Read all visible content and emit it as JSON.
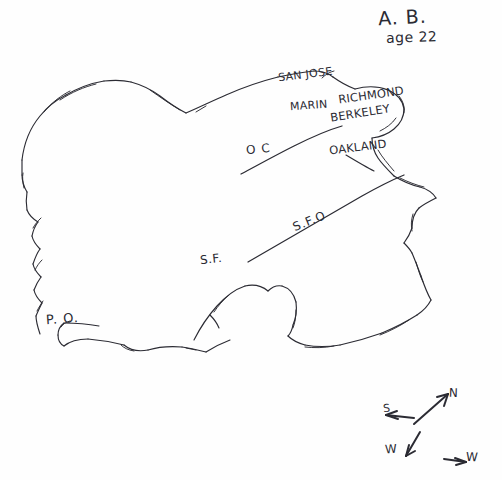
{
  "page": {
    "background_color": "#fefefe",
    "ink_color": "#2b2b33",
    "width": 502,
    "height": 480
  },
  "header": {
    "initials": "A. B.",
    "age": "age 22"
  },
  "labels": {
    "san_jose": "SAN JOSE",
    "marin": "MARIN",
    "richmond": "RICHMOND",
    "berkeley": "BERKELEY",
    "oakland": "OAKLAND",
    "oc": "O C",
    "sfo": "S.F.O",
    "sf": "S.F.",
    "po": "P. O."
  },
  "compass": {
    "north": "N",
    "south": "S",
    "southwest": "W",
    "east": "W"
  },
  "places": [
    {
      "name": "SAN JOSE",
      "x": 278,
      "y": 68
    },
    {
      "name": "MARIN",
      "x": 290,
      "y": 99
    },
    {
      "name": "RICHMOND",
      "x": 338,
      "y": 88
    },
    {
      "name": "BERKELEY",
      "x": 330,
      "y": 106
    },
    {
      "name": "OAKLAND",
      "x": 329,
      "y": 140
    },
    {
      "name": "O C",
      "x": 246,
      "y": 142
    },
    {
      "name": "S.F.O",
      "x": 292,
      "y": 214
    },
    {
      "name": "S.F.",
      "x": 200,
      "y": 252
    },
    {
      "name": "P. O.",
      "x": 46,
      "y": 311
    }
  ]
}
